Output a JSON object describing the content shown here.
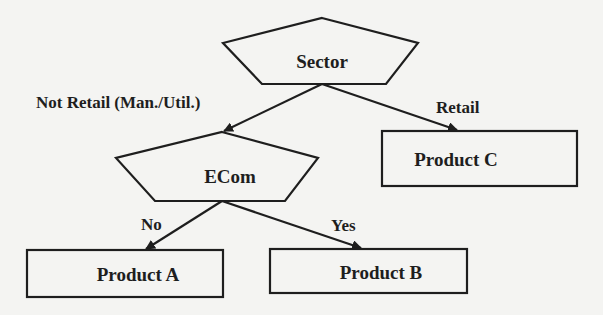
{
  "diagram": {
    "type": "decision-tree",
    "nodes": {
      "sector": {
        "label": "Sector",
        "shape": "pentagon"
      },
      "ecom": {
        "label": "ECom",
        "shape": "pentagon"
      },
      "product_a": {
        "label": "Product A",
        "shape": "rectangle"
      },
      "product_b": {
        "label": "Product B",
        "shape": "rectangle"
      },
      "product_c": {
        "label": "Product C",
        "shape": "rectangle"
      }
    },
    "edges": {
      "not_retail": {
        "from": "Sector",
        "to": "ECom",
        "label": "Not Retail (Man./Util.)"
      },
      "retail": {
        "from": "Sector",
        "to": "Product C",
        "label": "Retail"
      },
      "no": {
        "from": "ECom",
        "to": "Product A",
        "label": "No"
      },
      "yes": {
        "from": "ECom",
        "to": "Product B",
        "label": "Yes"
      }
    }
  },
  "colors": {
    "stroke": "#1e1e1e",
    "background": "#f4f4f2"
  }
}
